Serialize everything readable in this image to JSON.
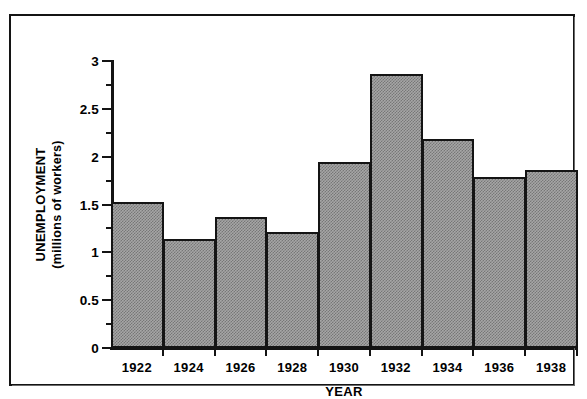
{
  "chart_data": {
    "type": "bar",
    "title": "",
    "xlabel": "YEAR",
    "ylabel_line1": "UNEMPLOYMENT",
    "ylabel_line2": "(millions of workers)",
    "categories": [
      "1922",
      "1924",
      "1926",
      "1928",
      "1930",
      "1932",
      "1934",
      "1936",
      "1938"
    ],
    "values": [
      1.53,
      1.14,
      1.37,
      1.21,
      1.94,
      2.86,
      2.19,
      1.79,
      1.86
    ],
    "ylim": [
      0,
      3
    ],
    "xlim_note": "bars are contiguous; x ticks fall on bar boundaries",
    "ytick_labels": [
      "0",
      "0.5",
      "1",
      "1.5",
      "2",
      "2.5",
      "3"
    ],
    "ytick_values": [
      0,
      0.5,
      1,
      1.5,
      2,
      2.5,
      3
    ],
    "yminor_values": [
      0.25,
      0.75,
      1.25,
      1.75,
      2.25,
      2.75
    ],
    "grid": false,
    "legend": "none",
    "series_name": "Unemployment",
    "bar_fill_color": "#a6a6a6",
    "bar_edge_color": "#141414",
    "axis_color": "#141414",
    "background_color": "#ffffff",
    "frame_color": "#141414"
  }
}
